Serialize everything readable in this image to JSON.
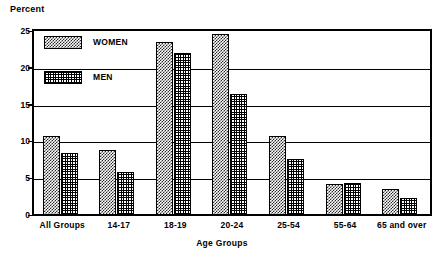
{
  "chart_data": {
    "type": "bar",
    "title": "",
    "xlabel": "Age Groups",
    "ylabel": "Percent",
    "ylim": [
      0,
      25
    ],
    "yticks": [
      0,
      5,
      10,
      15,
      20,
      25
    ],
    "ytick_labels": [
      "0",
      "5",
      "10",
      "15",
      "20",
      "25"
    ],
    "grid": true,
    "legend_position": "upper-left-inside",
    "categories": [
      "All Groups",
      "14-17",
      "18-19",
      "20-24",
      "25-54",
      "55-64",
      "65 and over"
    ],
    "series": [
      {
        "name": "WOMEN",
        "pattern": "stipple-checker",
        "values": [
          10.8,
          8.9,
          23.5,
          24.6,
          10.8,
          4.2,
          3.6
        ]
      },
      {
        "name": "MEN",
        "pattern": "cross-hatch",
        "values": [
          8.4,
          5.8,
          22.0,
          16.4,
          7.6,
          4.3,
          2.3
        ]
      }
    ]
  },
  "legend": {
    "items": [
      {
        "label": "WOMEN"
      },
      {
        "label": "MEN"
      }
    ]
  },
  "colors": {
    "axis": "#000000",
    "grid": "#000000",
    "background": "#ffffff",
    "pattern_ink": "#000000"
  }
}
